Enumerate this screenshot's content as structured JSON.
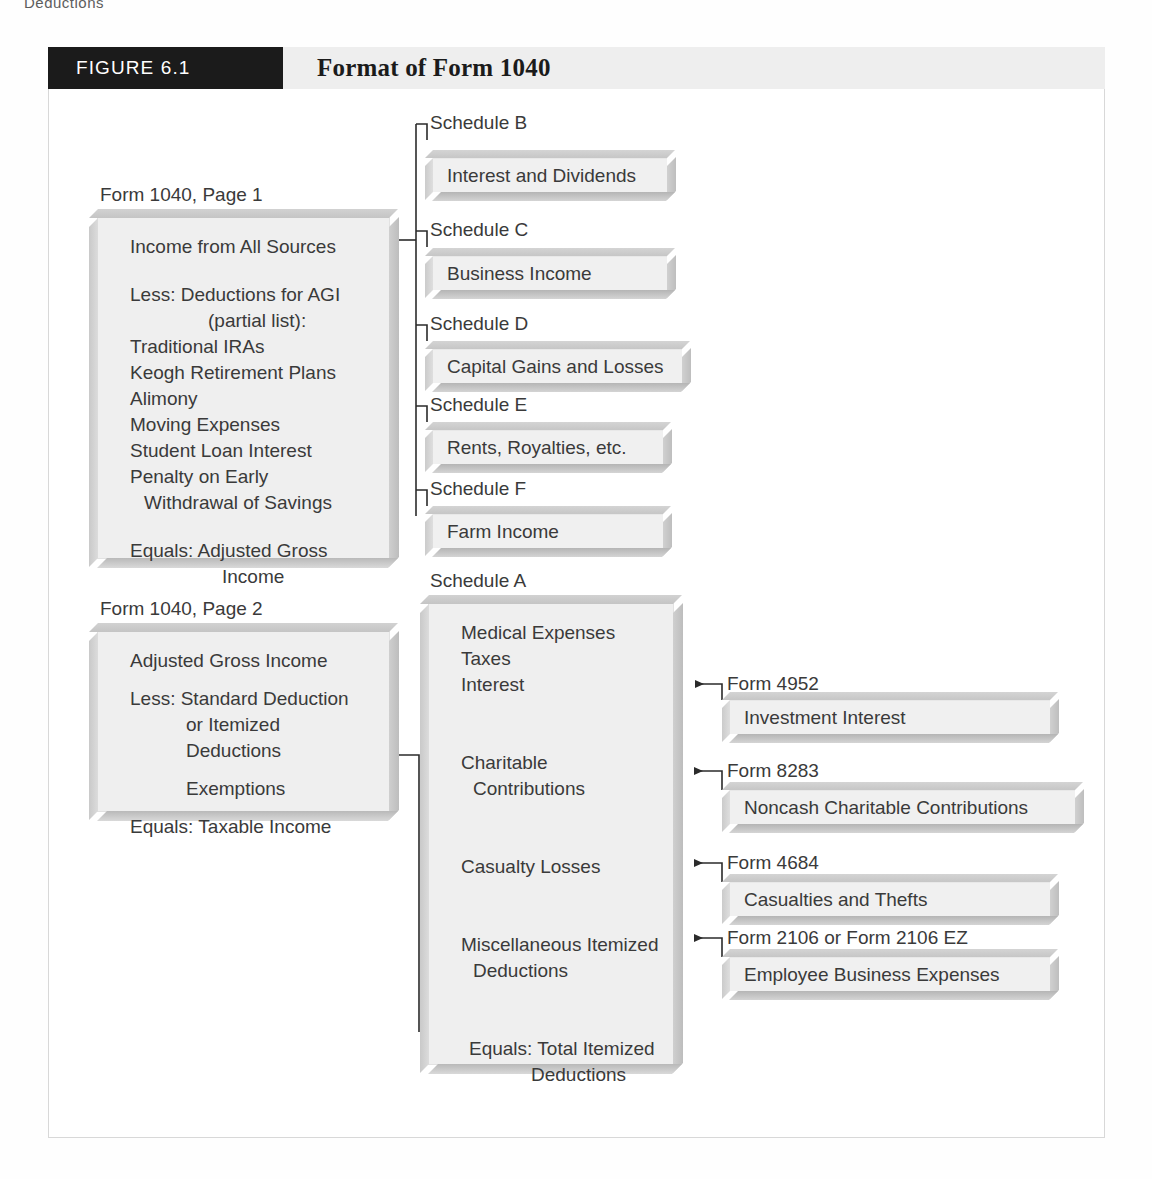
{
  "running_head": "Deductions",
  "figure": {
    "number_label": "FIGURE 6.1",
    "title": "Format of Form 1040"
  },
  "form_page1": {
    "caption": "Form 1040, Page 1",
    "lines": [
      "Income from All Sources",
      "Less: Deductions for AGI",
      "(partial list):",
      "Traditional IRAs",
      "Keogh Retirement Plans",
      "Alimony",
      "Moving Expenses",
      "Student Loan Interest",
      "Penalty on Early",
      "Withdrawal of Savings",
      "Equals: Adjusted Gross",
      "Income"
    ]
  },
  "form_page2": {
    "caption": "Form 1040, Page 2",
    "lines": [
      "Adjusted Gross Income",
      "Less: Standard Deduction",
      "or Itemized",
      "Deductions",
      "Exemptions",
      "Equals: Taxable Income"
    ]
  },
  "schedules": [
    {
      "name": "Schedule B",
      "description": "Interest and Dividends"
    },
    {
      "name": "Schedule C",
      "description": "Business Income"
    },
    {
      "name": "Schedule D",
      "description": "Capital Gains and Losses"
    },
    {
      "name": "Schedule E",
      "description": "Rents, Royalties, etc."
    },
    {
      "name": "Schedule F",
      "description": "Farm Income"
    }
  ],
  "schedule_a": {
    "caption": "Schedule A",
    "lines": [
      "Medical Expenses",
      "Taxes",
      "Interest",
      "Charitable",
      "Contributions",
      "Casualty Losses",
      "Miscellaneous Itemized",
      "Deductions",
      "Equals: Total Itemized",
      "Deductions"
    ]
  },
  "supporting_forms": [
    {
      "name": "Form 4952",
      "description": "Investment Interest"
    },
    {
      "name": "Form 8283",
      "description": "Noncash Charitable Contributions"
    },
    {
      "name": "Form 4684",
      "description": "Casualties and Thefts"
    },
    {
      "name": "Form 2106 or Form 2106 EZ",
      "description": "Employee Business Expenses"
    }
  ],
  "colors": {
    "header_black": "#1b1b1b",
    "header_gray": "#eeeeee",
    "panel_face": "#efefef",
    "text": "#3a3a3a",
    "frame_border": "#d8d8d8"
  }
}
